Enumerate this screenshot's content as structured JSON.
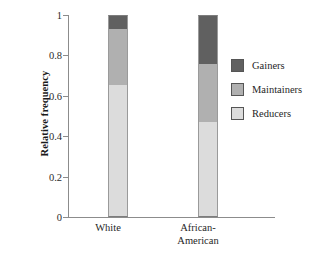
{
  "chart_data": {
    "type": "bar",
    "subtype": "stacked-bar-relative-frequency",
    "title": "",
    "xlabel": "",
    "ylabel": "Relative frequency",
    "categories": [
      "White",
      "African-\nAmerican"
    ],
    "category_labels_flat": [
      "White",
      "African-American"
    ],
    "ylim": [
      0,
      1
    ],
    "ytick_labels": [
      "0",
      "0.2",
      "0.4",
      "0.6",
      "0.8",
      "1"
    ],
    "ytick_values": [
      0,
      0.2,
      0.4,
      0.6,
      0.8,
      1
    ],
    "grid": false,
    "legend_position": "right",
    "stack_order_bottom_to_top": [
      "Reducers",
      "Maintainers",
      "Gainers"
    ],
    "series": [
      {
        "name": "Reducers",
        "values": [
          0.655,
          0.47
        ],
        "color": "#dcdcdc"
      },
      {
        "name": "Maintainers",
        "values": [
          0.275,
          0.287
        ],
        "color": "#b0b0b0"
      },
      {
        "name": "Gainers",
        "values": [
          0.07,
          0.243
        ],
        "color": "#606060"
      }
    ],
    "cumulative_boundaries": {
      "White": [
        0,
        0.655,
        0.93,
        1.0
      ],
      "African-American": [
        0,
        0.47,
        0.757,
        1.0
      ]
    }
  },
  "legend": {
    "items": [
      {
        "label": "Gainers",
        "color": "#606060"
      },
      {
        "label": "Maintainers",
        "color": "#b0b0b0"
      },
      {
        "label": "Reducers",
        "color": "#dcdcdc"
      }
    ]
  },
  "colors": {
    "gainers": "#606060",
    "maintainers": "#b0b0b0",
    "reducers": "#dcdcdc",
    "axis": "#8c8c8c",
    "background": "#ffffff"
  }
}
